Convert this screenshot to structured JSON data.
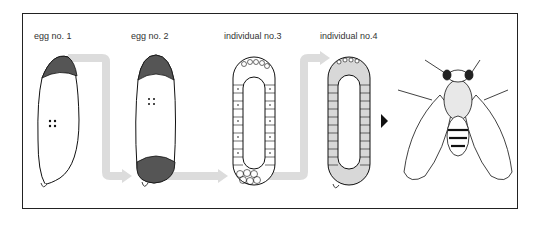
{
  "labels": {
    "egg1": "egg no. 1",
    "egg2": "egg no. 2",
    "ind3": "individual no.3",
    "ind4": "individual no.4"
  },
  "colors": {
    "frame": "#222222",
    "arrow": "#dcdcdc",
    "dark_cap": "#555555",
    "cell_fill_4": "#d8d8d8",
    "pointer": "#111111"
  }
}
